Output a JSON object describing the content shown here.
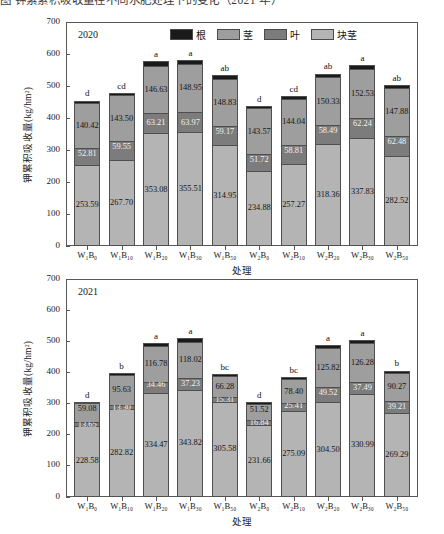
{
  "caption": "图  钾素累积吸收量在不同水肥处理下的变化（2021 年）",
  "axis": {
    "ylabel": "钾累积吸收量(kg/hm²)",
    "xlabel": "处理",
    "yticks": [
      0,
      100,
      200,
      300,
      400,
      500,
      600,
      700
    ],
    "ylim": [
      0,
      700
    ]
  },
  "legend": [
    {
      "name": "root",
      "label": "根",
      "color": "#1a1a1a"
    },
    {
      "name": "stem",
      "label": "茎",
      "color": "#9e9e9e"
    },
    {
      "name": "leaf",
      "label": "叶",
      "color": "#7c7c7c"
    },
    {
      "name": "tuber",
      "label": "块茎",
      "color": "#b4b4b4"
    }
  ],
  "colors": {
    "root": "#1a1a1a",
    "stem": "#9e9e9e",
    "leaf": "#7c7c7c",
    "tuber": "#b4b4b4",
    "axis": "#585858",
    "text": "#1a1a1a"
  },
  "categories": [
    "W₁B₀",
    "W₁B₁₀",
    "W₁B₂₀",
    "W₁B₃₀",
    "W₁B₅₀",
    "W₂B₀",
    "W₂B₁₀",
    "W₂B₂₀",
    "W₂B₃₀",
    "W₂B₅₀"
  ],
  "chart_data": [
    {
      "type": "bar",
      "subtype": "stacked",
      "title": "2020",
      "xlabel": "处理",
      "ylabel": "钾累积吸收量(kg/hm²)",
      "ylim": [
        0,
        700
      ],
      "yticks": [
        0,
        100,
        200,
        300,
        400,
        500,
        600,
        700
      ],
      "grid": false,
      "legend_position": "top",
      "categories": [
        "W₁B₀",
        "W₁B₁₀",
        "W₁B₂₀",
        "W₁B₃₀",
        "W₁B₅₀",
        "W₂B₀",
        "W₂B₁₀",
        "W₂B₂₀",
        "W₂B₃₀",
        "W₂B₅₀"
      ],
      "series": [
        {
          "name": "块茎",
          "key": "tuber",
          "values": [
            253.59,
            267.7,
            353.08,
            355.51,
            314.95,
            234.88,
            257.27,
            318.36,
            337.83,
            282.52
          ]
        },
        {
          "name": "叶",
          "key": "leaf",
          "values": [
            52.81,
            59.55,
            63.21,
            63.97,
            59.17,
            51.72,
            58.81,
            58.49,
            62.24,
            62.48
          ]
        },
        {
          "name": "茎",
          "key": "stem",
          "values": [
            140.42,
            143.5,
            146.63,
            148.95,
            148.83,
            143.57,
            144.04,
            150.33,
            152.53,
            147.88
          ]
        },
        {
          "name": "根",
          "key": "root",
          "values": [
            8.0,
            8.5,
            14.0,
            14.0,
            11.0,
            8.0,
            9.0,
            12.0,
            13.0,
            11.0
          ]
        }
      ],
      "significance": [
        "d",
        "cd",
        "a",
        "a",
        "ab",
        "d",
        "cd",
        "ab",
        "a",
        "ab"
      ]
    },
    {
      "type": "bar",
      "subtype": "stacked",
      "title": "2021",
      "xlabel": "处理",
      "ylabel": "钾累积吸收量(kg/hm²)",
      "ylim": [
        0,
        700
      ],
      "yticks": [
        0,
        100,
        200,
        300,
        400,
        500,
        600,
        700
      ],
      "grid": false,
      "legend_position": "none",
      "categories": [
        "W₁B₀",
        "W₁B₁₀",
        "W₁B₂₀",
        "W₁B₃₀",
        "W₁B₅₀",
        "W₂B₀",
        "W₂B₁₀",
        "W₂B₂₀",
        "W₂B₃₀",
        "W₂B₅₀"
      ],
      "series": [
        {
          "name": "块茎",
          "key": "tuber",
          "values": [
            228.58,
            282.82,
            334.47,
            343.82,
            305.58,
            231.66,
            275.09,
            304.5,
            330.99,
            269.29
          ]
        },
        {
          "name": "叶",
          "key": "leaf",
          "values": [
            13.65,
            13.3,
            34.46,
            37.23,
            15.31,
            16.84,
            25.41,
            49.52,
            37.49,
            39.21
          ]
        },
        {
          "name": "茎",
          "key": "stem",
          "values": [
            59.08,
            95.63,
            116.78,
            118.02,
            66.28,
            51.52,
            78.4,
            125.82,
            126.28,
            90.27
          ]
        },
        {
          "name": "根",
          "key": "root",
          "values": [
            5.0,
            6.5,
            10.0,
            10.0,
            7.0,
            5.0,
            6.0,
            9.0,
            10.0,
            7.5
          ]
        }
      ],
      "significance": [
        "d",
        "b",
        "a",
        "a",
        "bc",
        "d",
        "bc",
        "a",
        "a",
        "b"
      ]
    }
  ]
}
